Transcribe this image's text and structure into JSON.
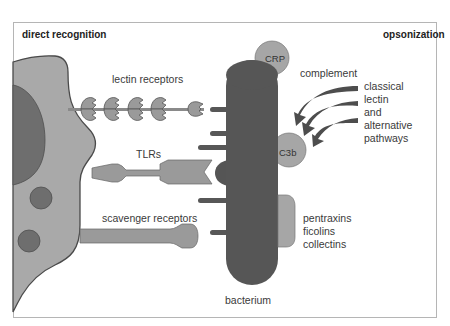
{
  "diagram": {
    "panel_titles": {
      "left": "direct recognition",
      "right": "opsonization"
    },
    "labels": {
      "lectin_receptors": "lectin receptors",
      "tlrs": "TLRs",
      "scavenger_receptors": "scavenger receptors",
      "crp": "CRP",
      "complement": "complement",
      "c3b": "C3b",
      "bacterium": "bacterium",
      "pathways": [
        "classical",
        "lectin",
        "and",
        "alternative",
        "pathways"
      ],
      "soluble_recognition": [
        "pentraxins",
        "ficolins",
        "collectins"
      ]
    },
    "colors": {
      "cell": "#a9a9a9",
      "cell_outline": "#4a4a4a",
      "nucleus": "#6e6e6e",
      "bacterium": "#565656",
      "receptor": "#9a9a9a",
      "opsonin": "#a6a6a6",
      "arrow": "#4d4d4d",
      "frame": "#b5b5b5"
    }
  }
}
